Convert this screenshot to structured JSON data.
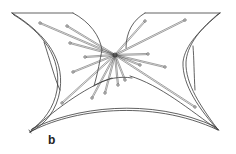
{
  "figure": {
    "panel_label": "b",
    "colors": {
      "stroke": "#3a3a3a",
      "pin_body": "#555555",
      "pin_head": "#444444",
      "background": "#ffffff"
    },
    "center": [
      115,
      55
    ],
    "corners": {
      "top_left": [
        12,
        13
      ],
      "top_right": [
        220,
        13
      ],
      "bottom_left": [
        30,
        132
      ],
      "bottom_right": [
        218,
        130
      ]
    },
    "pins": [
      {
        "end": [
          40,
          23
        ]
      },
      {
        "end": [
          67,
          26
        ]
      },
      {
        "end": [
          70,
          43
        ]
      },
      {
        "end": [
          85,
          57
        ]
      },
      {
        "end": [
          73,
          72
        ]
      },
      {
        "end": [
          62,
          103
        ]
      },
      {
        "end": [
          92,
          98
        ]
      },
      {
        "end": [
          105,
          93
        ]
      },
      {
        "end": [
          118,
          85
        ]
      },
      {
        "end": [
          125,
          80
        ]
      },
      {
        "end": [
          145,
          21
        ]
      },
      {
        "end": [
          185,
          20
        ]
      },
      {
        "end": [
          148,
          54
        ]
      },
      {
        "end": [
          165,
          67
        ]
      },
      {
        "end": [
          140,
          65
        ]
      },
      {
        "end": [
          195,
          107
        ]
      }
    ]
  }
}
